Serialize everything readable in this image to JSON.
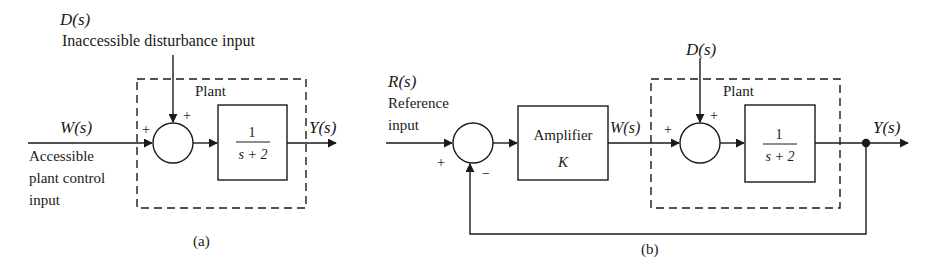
{
  "diagram_a": {
    "caption": "(a)",
    "disturbance_label": "D(s)",
    "disturbance_desc": "Inaccessible disturbance input",
    "plant_label": "Plant",
    "input_label": "W(s)",
    "input_desc_lines": [
      "Accessible",
      "plant control",
      "input"
    ],
    "output_label": "Y(s)",
    "sum_signs": {
      "left": "+",
      "top": "+"
    },
    "transfer_function": {
      "numerator": "1",
      "denominator": "s + 2"
    }
  },
  "diagram_b": {
    "caption": "(b)",
    "reference_label": "R(s)",
    "reference_desc_lines": [
      "Reference",
      "input"
    ],
    "sum1_signs": {
      "left": "+",
      "bottom": "−"
    },
    "amplifier": {
      "title": "Amplifier",
      "gain": "K"
    },
    "intermediate_label": "W(s)",
    "disturbance_label": "D(s)",
    "plant_label": "Plant",
    "sum2_signs": {
      "left": "+",
      "top": "+"
    },
    "transfer_function": {
      "numerator": "1",
      "denominator": "s + 2"
    },
    "output_label": "Y(s)"
  },
  "colors": {
    "ink": "#1a1a1a",
    "background": "#ffffff"
  }
}
